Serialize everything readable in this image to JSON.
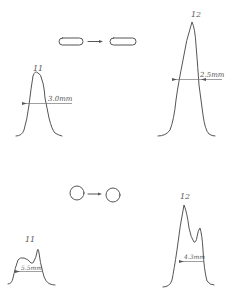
{
  "figure": {
    "top_section": {
      "shape": "elongated-capsule",
      "transition": "capsule-to-capsule",
      "left_profile": {
        "label": "11",
        "width_annotation": "3.0mm"
      },
      "right_profile": {
        "label": "12",
        "width_annotation": "2.5mm"
      }
    },
    "bottom_section": {
      "shape": "circle",
      "transition": "circle-to-circle",
      "left_profile": {
        "label": "11",
        "width_annotation": "5.5mm"
      },
      "right_profile": {
        "label": "12",
        "width_annotation": "4.3mm"
      }
    }
  },
  "colors": {
    "line": "#555555",
    "background": "#ffffff"
  }
}
